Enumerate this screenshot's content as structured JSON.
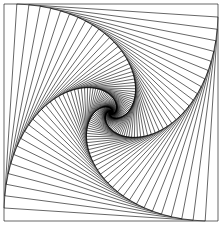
{
  "diagram": {
    "title": "",
    "type": "nested-rotating-squares-whirl",
    "outer_square": {
      "x1": 4,
      "y1": 4,
      "x2": 218,
      "y2": 221
    },
    "iterations": 90,
    "step_fraction": 0.06,
    "stroke_color": "#000000",
    "background_color": "#ffffff",
    "stroke_width": 0.6
  }
}
